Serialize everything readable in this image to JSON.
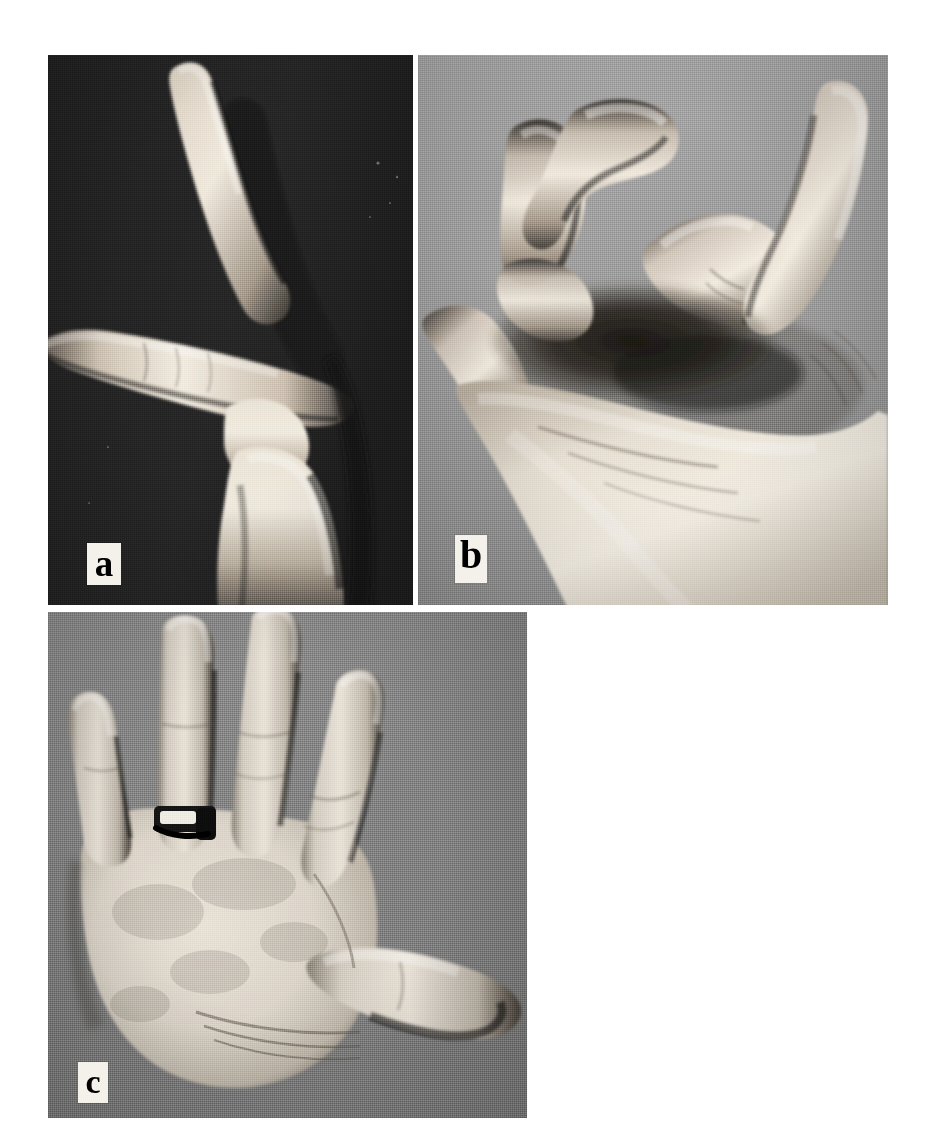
{
  "figure": {
    "kind": "multi-panel-photograph-plate",
    "background_color": "#ffffff",
    "panel_count": 3
  },
  "panels": [
    {
      "id": "a",
      "label": "a",
      "label_style": "black serif letter on white rectangular badge",
      "subject": "hand-in-profile",
      "description": "Side view of a hand against a dark background: index finger extended upward and angled, middle finger in deep shadow behind it, another finger extended horizontally to the left, thumb and knuckle prominent below.",
      "background_tone": "dark",
      "background_color": "#2a2a2a",
      "skin_highlight_color": "#efe9e0",
      "skin_midtone_color": "#bdb4a8",
      "skin_shadow_color": "#4a443d",
      "bounds": {
        "x": 48,
        "y": 55,
        "width": 365,
        "height": 550
      }
    },
    {
      "id": "b",
      "label": "b",
      "label_style": "black serif letter on white rectangular badge",
      "subject": "hand-with-flexed-fingers",
      "description": "Hand against a mid-grey background with fingers strongly flexed and interlocking at the knuckles, thumb raised at the right, forearm descending to the lower right.",
      "background_tone": "medium-grey",
      "background_color": "#a2a2a2",
      "skin_highlight_color": "#f2ece3",
      "skin_midtone_color": "#c6bcaf",
      "skin_shadow_color": "#57504a",
      "bounds": {
        "x": 418,
        "y": 55,
        "width": 470,
        "height": 550
      }
    },
    {
      "id": "c",
      "label": "c",
      "label_style": "black serif letter on white rectangular badge",
      "subject": "hand-dorsum-spread",
      "description": "Dorsal view of a spread hand on a grey background, four fingers extended upward and thumb abducted to the lower right; a dark wedding band is worn on the ring finger.",
      "background_tone": "medium-grey",
      "background_color": "#888888",
      "skin_highlight_color": "#e8e2d8",
      "skin_midtone_color": "#c3bbb0",
      "skin_shadow_color": "#5d564e",
      "accessory": "wedding-ring",
      "accessory_color": "#1b1b1b",
      "bounds": {
        "x": 48,
        "y": 612,
        "width": 479,
        "height": 506
      }
    }
  ]
}
